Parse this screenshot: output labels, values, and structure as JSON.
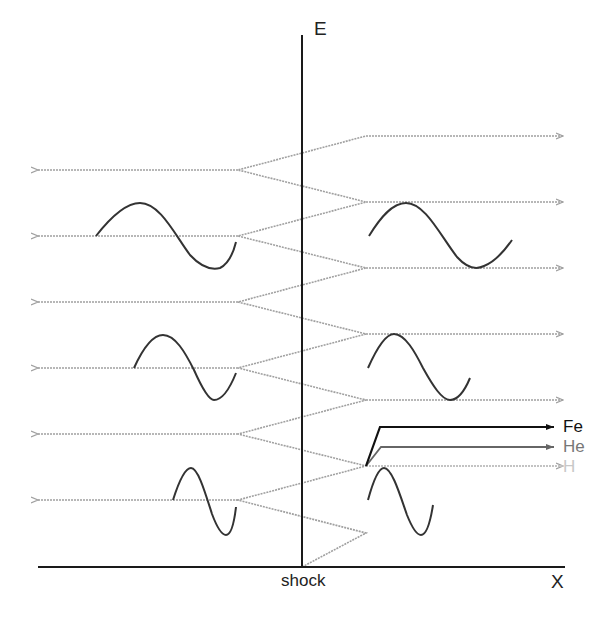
{
  "diagram": {
    "axes": {
      "y_label": "E",
      "x_label": "X",
      "shock_label": "shock"
    },
    "species": [
      {
        "label": "Fe",
        "color": "#111111"
      },
      {
        "label": "He",
        "color": "#777777"
      },
      {
        "label": "H",
        "color": "#c8c8c8"
      }
    ],
    "colors": {
      "axis": "#1a1a1a",
      "path": "#a0a0a0",
      "wave": "#333333"
    },
    "geometry": {
      "shock_x": 302,
      "axis_y": 567,
      "upstream_vertex_x": 238,
      "downstream_vertex_x": 366,
      "upstream_levels_y": [
        170,
        236,
        302,
        368,
        434,
        500
      ],
      "downstream_levels_y": [
        136,
        202,
        268,
        334,
        400,
        466
      ]
    }
  }
}
